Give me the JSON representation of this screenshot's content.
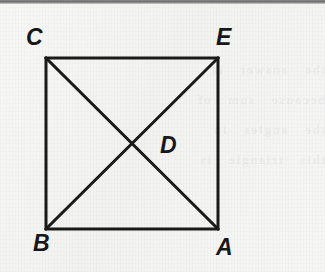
{
  "figure": {
    "kind": "geometric-diagram",
    "background_color": "#f4f4f2",
    "ink_color": "#1a1a1a",
    "scan_edge_band_color": "#6d6d6d",
    "bleed_through_text": "the   answer   is\nbecause   sum   of\nthe   angles   in\nthis   triangle   is",
    "shape": {
      "name": "square",
      "stroke_width": 3,
      "corners": [
        {
          "label": "C",
          "x": 46,
          "y": 58
        },
        {
          "label": "E",
          "x": 218,
          "y": 58
        },
        {
          "label": "A",
          "x": 218,
          "y": 229
        },
        {
          "label": "B",
          "x": 46,
          "y": 229
        }
      ]
    },
    "diagonals": [
      {
        "name": "diagonal-C-A",
        "from": "C",
        "to": "A",
        "stroke_width": 3
      },
      {
        "name": "diagonal-E-B",
        "from": "E",
        "to": "B",
        "stroke_width": 3
      }
    ],
    "intersection": {
      "label": "D",
      "x": 132,
      "y": 143
    },
    "labels": [
      {
        "id": "C",
        "text": "C",
        "left": 26,
        "top": 26
      },
      {
        "id": "E",
        "text": "E",
        "left": 216,
        "top": 26
      },
      {
        "id": "D",
        "text": "D",
        "left": 160,
        "top": 134
      },
      {
        "id": "B",
        "text": "B",
        "left": 33,
        "top": 232
      },
      {
        "id": "A",
        "text": "A",
        "left": 216,
        "top": 236
      }
    ]
  }
}
